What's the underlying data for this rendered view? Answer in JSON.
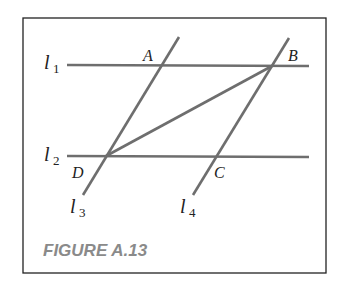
{
  "figure": {
    "caption": "FIGURE A.13",
    "lines": [
      {
        "name": "l",
        "sub": "1"
      },
      {
        "name": "l",
        "sub": "2"
      },
      {
        "name": "l",
        "sub": "3"
      },
      {
        "name": "l",
        "sub": "4"
      }
    ],
    "points": {
      "A": "A",
      "B": "B",
      "C": "C",
      "D": "D"
    },
    "colors": {
      "line": "#6e6e6e",
      "border": "#222222",
      "caption": "#8a8a8a"
    }
  }
}
